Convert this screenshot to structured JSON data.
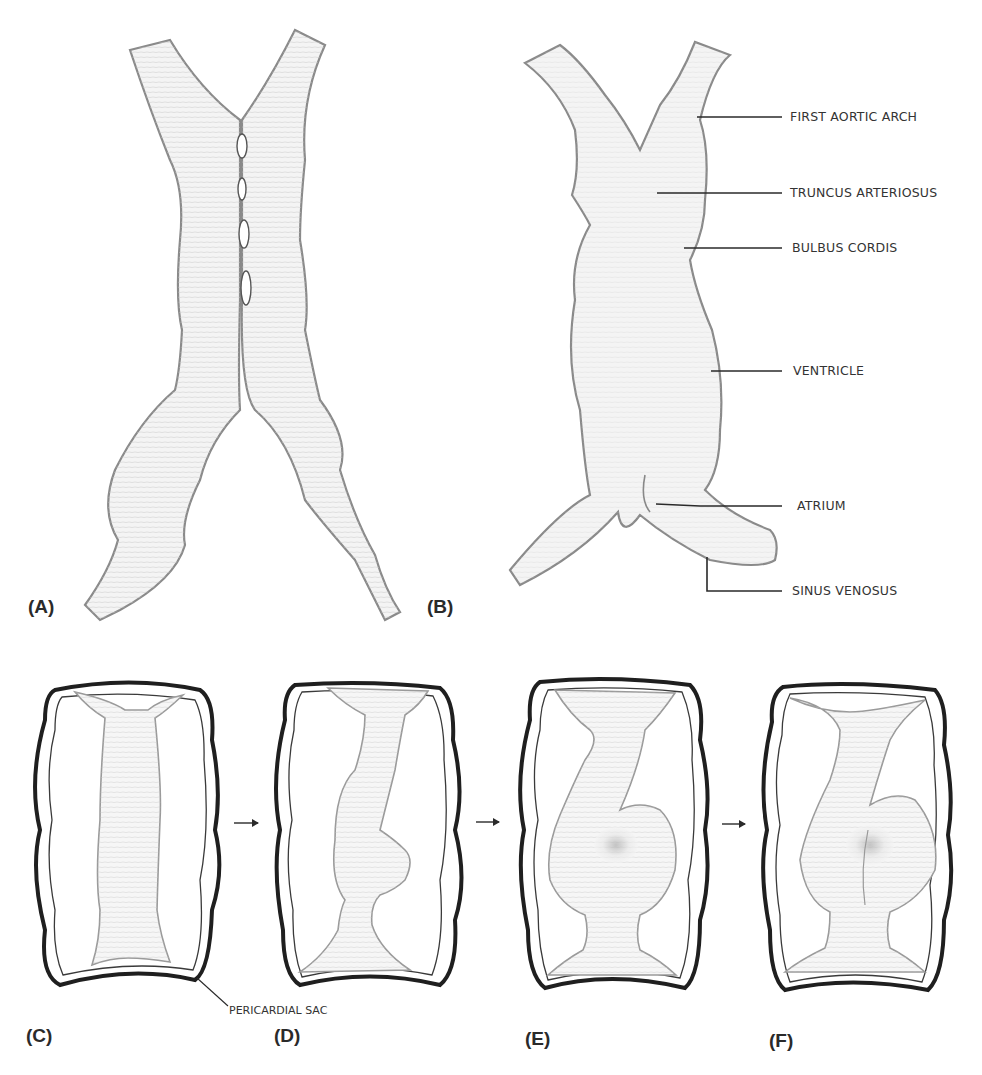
{
  "figure": {
    "panels": [
      {
        "id": "A",
        "label": "(A)",
        "description": "Paired endocardial heart tubes fusing at the midline"
      },
      {
        "id": "B",
        "label": "(B)",
        "description": "Fused primitive heart tube with labeled regions"
      },
      {
        "id": "C",
        "label": "(C)",
        "description": "Straight heart tube within pericardial sac"
      },
      {
        "id": "D",
        "label": "(D)",
        "description": "Heart tube beginning to bend"
      },
      {
        "id": "E",
        "label": "(E)",
        "description": "Heart tube looping"
      },
      {
        "id": "F",
        "label": "(F)",
        "description": "Completed cardiac loop"
      }
    ],
    "panel_b_labels": {
      "first_aortic_arch": "FIRST AORTIC ARCH",
      "truncus_arteriosus": "TRUNCUS ARTERIOSUS",
      "bulbus_cordis": "BULBUS CORDIS",
      "ventricle": "VENTRICLE",
      "atrium": "ATRIUM",
      "sinus_venosus": "SINUS VENOSUS"
    },
    "panel_c_label": "PERICARDIAL SAC",
    "arrows": [
      "arrow-c-to-d",
      "arrow-d-to-e",
      "arrow-e-to-f"
    ],
    "colors": {
      "ink": "#2a2a2a",
      "pencil": "#8a8a8a",
      "paper": "#ffffff"
    }
  }
}
